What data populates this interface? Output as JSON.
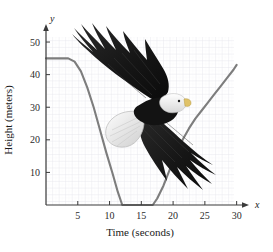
{
  "figure": {
    "background_color": "#ffffff",
    "curve_color": "#7d7d7d",
    "axis_color": "#3a3a3a",
    "grid_major_color": "#e2e2e8",
    "grid_minor_color": "#f0f0f4"
  },
  "axes": {
    "x_axis_name": "x",
    "y_axis_name": "y",
    "x_axis_title": "Time (seconds)",
    "y_axis_title": "Height (meters)",
    "x_ticks": [
      5,
      10,
      15,
      20,
      25,
      30
    ],
    "y_ticks": [
      10,
      20,
      30,
      40,
      50
    ],
    "x_tick_labels": [
      "5",
      "10",
      "15",
      "20",
      "25",
      "30"
    ],
    "y_tick_labels": [
      "10",
      "20",
      "30",
      "40",
      "50"
    ]
  },
  "image": {
    "subject": "bald-eagle-soaring",
    "alt": "Photograph of a bald eagle in flight with wings spread"
  },
  "chart_data": {
    "type": "line",
    "title": "",
    "xlabel": "Time (seconds)",
    "ylabel": "Height (meters)",
    "xlim": [
      0,
      31
    ],
    "ylim": [
      0,
      54
    ],
    "grid": true,
    "legend": "none",
    "series": [
      {
        "name": "Height of eagle over time",
        "x": [
          0,
          2,
          3.5,
          4.5,
          5.5,
          6.5,
          7.5,
          8.5,
          9.5,
          10.5,
          11.3,
          12,
          14,
          16,
          16.8,
          17.5,
          18.5,
          19.5,
          20.5,
          21.5,
          22.5,
          23.5,
          24.5,
          25.5,
          26.5,
          27.5,
          28.5,
          29.5,
          30
        ],
        "values": [
          45,
          45,
          45,
          44,
          41,
          36,
          30,
          23,
          16,
          9.5,
          4,
          0,
          0,
          0,
          0,
          2,
          6,
          11,
          16,
          20,
          23.5,
          26.5,
          29,
          31.5,
          34,
          36.5,
          39,
          41.5,
          43
        ]
      }
    ],
    "annotations": [
      {
        "text": "constant height 45 m until t ≈ 3.5 s"
      },
      {
        "text": "ground level from t ≈ 12 s to t ≈ 17 s"
      },
      {
        "text": "rises again reaching about 43 m at t = 30 s"
      }
    ]
  }
}
